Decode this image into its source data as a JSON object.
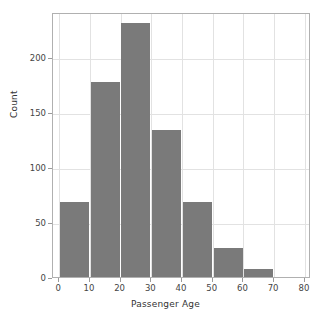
{
  "chart_data": {
    "type": "bar",
    "title": "",
    "xlabel": "Passenger Age",
    "ylabel": "Count",
    "categories": [
      "0-10",
      "10-20",
      "20-30",
      "30-40",
      "40-50",
      "50-60",
      "60-70"
    ],
    "bin_edges": [
      0,
      10,
      20,
      30,
      40,
      50,
      60,
      70
    ],
    "bin_width": 10,
    "values": [
      68,
      177,
      231,
      134,
      68,
      26,
      7
    ],
    "xlim": [
      -2,
      82
    ],
    "ylim": [
      0,
      241
    ],
    "xticks": [
      0,
      10,
      20,
      30,
      40,
      50,
      60,
      70,
      80
    ],
    "xtick_labels": [
      "0",
      "10",
      "20",
      "30",
      "40",
      "50",
      "60",
      "70",
      "80"
    ],
    "yticks": [
      0,
      50,
      100,
      150,
      200
    ],
    "ytick_labels": [
      "0",
      "50",
      "100",
      "150",
      "200"
    ],
    "grid": true,
    "grid_axis": "both",
    "legend": false,
    "bar_color": "#7a7a7a",
    "grid_color": "#e2e2e2",
    "frame_color": "#b0b0b0",
    "background": "#ffffff"
  },
  "axis": {
    "x_title": "Passenger Age",
    "y_title": "Count"
  }
}
